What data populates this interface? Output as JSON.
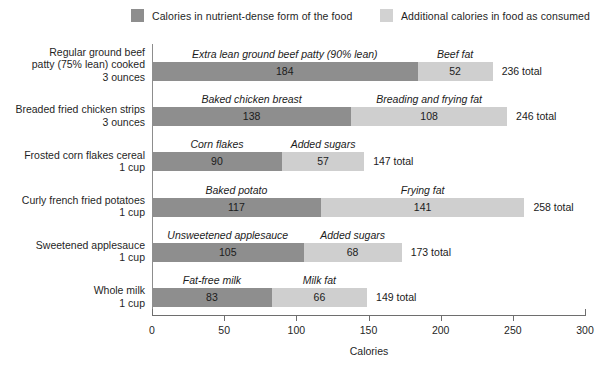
{
  "legend": {
    "items": [
      {
        "label": "Calories in nutrient-dense form of the food",
        "swatch": "dark-swatch-icon",
        "color": "#8e8e8e"
      },
      {
        "label": "Additional calories in food as consumed",
        "swatch": "light-swatch-icon",
        "color": "#d2d2d2"
      }
    ]
  },
  "chart_data": {
    "type": "bar",
    "orientation": "horizontal",
    "stacked": true,
    "title": "",
    "xlabel": "Calories",
    "ylabel": "",
    "xlim": [
      0,
      300
    ],
    "xticks": [
      0,
      50,
      100,
      150,
      200,
      250,
      300
    ],
    "grid": false,
    "legend_position": "top",
    "series": [
      {
        "name": "Calories in nutrient-dense form of the food",
        "color": "#8e8e8e"
      },
      {
        "name": "Additional calories in food as consumed",
        "color": "#cfcfcf"
      }
    ],
    "categories": [
      "Regular ground beef patty (75% lean) cooked 3 ounces",
      "Breaded fried chicken strips 3 ounces",
      "Frosted corn flakes cereal 1 cup",
      "Curly french fried potatoes 1 cup",
      "Sweetened applesauce 1 cup",
      "Whole milk 1 cup"
    ],
    "rows": [
      {
        "category_lines": [
          "Regular ground beef",
          "patty (75% lean) cooked",
          "3 ounces"
        ],
        "base": {
          "name": "Extra lean ground beef patty (90% lean)",
          "value": 184
        },
        "extra": {
          "name": "Beef fat",
          "value": 52
        },
        "total_label": "236 total",
        "total": 236
      },
      {
        "category_lines": [
          "Breaded fried chicken strips",
          "3 ounces"
        ],
        "base": {
          "name": "Baked chicken breast",
          "value": 138
        },
        "extra": {
          "name": "Breading and frying fat",
          "value": 108
        },
        "total_label": "246 total",
        "total": 246
      },
      {
        "category_lines": [
          "Frosted corn flakes cereal",
          "1 cup"
        ],
        "base": {
          "name": "Corn flakes",
          "value": 90
        },
        "extra": {
          "name": "Added sugars",
          "value": 57
        },
        "total_label": "147 total",
        "total": 147
      },
      {
        "category_lines": [
          "Curly french fried potatoes",
          "1 cup"
        ],
        "base": {
          "name": "Baked potato",
          "value": 117
        },
        "extra": {
          "name": "Frying fat",
          "value": 141
        },
        "total_label": "258 total",
        "total": 258
      },
      {
        "category_lines": [
          "Sweetened applesauce",
          "1 cup"
        ],
        "base": {
          "name": "Unsweetened applesauce",
          "value": 105
        },
        "extra": {
          "name": "Added sugars",
          "value": 68
        },
        "total_label": "173 total",
        "total": 173
      },
      {
        "category_lines": [
          "Whole milk",
          "1 cup"
        ],
        "base": {
          "name": "Fat-free milk",
          "value": 83
        },
        "extra": {
          "name": "Milk fat",
          "value": 66
        },
        "total_label": "149 total",
        "total": 149
      }
    ]
  }
}
